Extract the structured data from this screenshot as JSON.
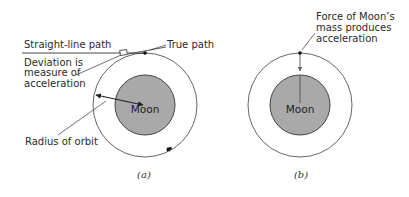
{
  "diagram": {
    "panel_a": {
      "caption": "(a)",
      "body_label": "Moon",
      "labels": {
        "straight_line": "Straight-line path",
        "true_path": "True path",
        "deviation_line1": "Deviation is",
        "deviation_line2": "measure of",
        "deviation_line3": "acceleration",
        "radius": "Radius of orbit"
      }
    },
    "panel_b": {
      "caption": "(b)",
      "body_label": "Moon",
      "labels": {
        "force_line1": "Force of Moon’s",
        "force_line2": "mass produces",
        "force_line3": "acceleration"
      }
    },
    "colors": {
      "moon_fill": "#a9a9a9",
      "orbit_stroke": "#555555",
      "line": "#333333"
    }
  }
}
